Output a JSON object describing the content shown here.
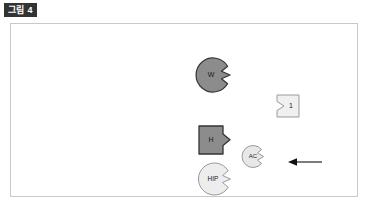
{
  "figure": {
    "caption_badge": "그림 4",
    "frame": {
      "border_color": "#c9c9c9",
      "background": "#ffffff"
    }
  },
  "diagram": {
    "type": "shape-diagram",
    "shapes": [
      {
        "id": "w",
        "label": "W",
        "form": "circle-with-right-notch",
        "fill": "#8c8c8c",
        "stroke": "#333333",
        "radius": 17
      },
      {
        "id": "box1",
        "label": "1",
        "form": "square-with-left-notch",
        "fill": "#f0f0f0",
        "stroke": "#9a9a9a",
        "size": 22
      },
      {
        "id": "h",
        "label": "H",
        "form": "square-with-right-notch",
        "fill": "#8c8c8c",
        "stroke": "#333333",
        "size": 26
      },
      {
        "id": "ac",
        "label": "AC",
        "form": "circle-with-right-notch",
        "fill": "#e8e8e8",
        "stroke": "#999999",
        "radius": 11
      },
      {
        "id": "hip",
        "label": "HIP",
        "form": "circle-with-right-notch",
        "fill": "#ededed",
        "stroke": "#9a9a9a",
        "radius": 16
      }
    ],
    "annotations": [
      {
        "id": "arrow-left",
        "type": "arrow",
        "direction": "left",
        "color": "#111111",
        "length": 34
      }
    ]
  }
}
